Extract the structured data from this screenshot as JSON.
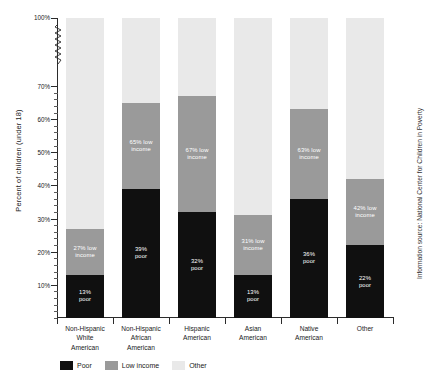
{
  "chart_data": {
    "type": "bar",
    "title": "",
    "subtitle": "",
    "stacked": true,
    "xlabel": "",
    "ylabel": "Percent of children (under 18)",
    "ylim": [
      0,
      100
    ],
    "y_axis_break": "between 70% and 100%",
    "grid": false,
    "legend_position": "bottom-left",
    "tick_labels": [
      "100%",
      "70%",
      "60%",
      "50%",
      "40%",
      "30%",
      "20%",
      "10%"
    ],
    "tick_values": [
      100,
      70,
      60,
      50,
      40,
      30,
      20,
      10
    ],
    "categories": [
      "Non-Hispanic\nWhite\nAmerican",
      "Non-Hispanic\nAfrican\nAmerican",
      "Hispanic\nAmerican",
      "Asian\nAmerican",
      "Native\nAmerican",
      "Other"
    ],
    "series": [
      {
        "name": "Poor",
        "color": "#101010",
        "values": [
          13,
          39,
          32,
          13,
          36,
          22
        ]
      },
      {
        "name": "Low income",
        "color": "#9a9a9a",
        "values": [
          27,
          65,
          67,
          31,
          63,
          42
        ]
      },
      {
        "name": "Other",
        "color": "#e9e9e9",
        "values": [
          60,
          36,
          33,
          56,
          37,
          58
        ]
      }
    ],
    "bar_labels": [
      {
        "poor": "13%\npoor",
        "low": "27% low\nincome",
        "other": ""
      },
      {
        "poor": "39%\npoor",
        "low": "65% low\nincome",
        "other": ""
      },
      {
        "poor": "32%\npoor",
        "low": "67% low\nincome",
        "other": ""
      },
      {
        "poor": "13%\npoor",
        "low": "31% low\nincome",
        "other": ""
      },
      {
        "poor": "36%\npoor",
        "low": "63% low\nincome",
        "other": ""
      },
      {
        "poor": "22%\npoor",
        "low": "42% low\nincome",
        "other": ""
      }
    ],
    "annotations": [
      "Information source: National Center for Children in Poverty"
    ]
  },
  "legend": {
    "items": [
      {
        "label": "Poor",
        "color": "#101010"
      },
      {
        "label": "Low income",
        "color": "#9a9a9a"
      },
      {
        "label": "Other",
        "color": "#e9e9e9"
      }
    ]
  },
  "source": {
    "text": "Information source: National Center for Children in Poverty"
  }
}
